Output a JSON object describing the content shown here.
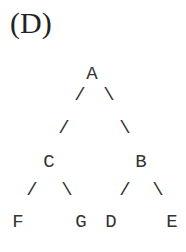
{
  "label": "(D)",
  "tree": {
    "nodes": [
      {
        "id": "A",
        "x": 92,
        "y": 65
      },
      {
        "id": "C",
        "x": 49,
        "y": 153
      },
      {
        "id": "B",
        "x": 141,
        "y": 153
      },
      {
        "id": "F",
        "x": 18,
        "y": 213
      },
      {
        "id": "G",
        "x": 81,
        "y": 213
      },
      {
        "id": "D",
        "x": 111,
        "y": 213
      },
      {
        "id": "E",
        "x": 172,
        "y": 213
      }
    ],
    "edges": [
      {
        "ch": "/",
        "x": 80,
        "y": 86
      },
      {
        "ch": "\\",
        "x": 109,
        "y": 86
      },
      {
        "ch": "/",
        "x": 64,
        "y": 119
      },
      {
        "ch": "\\",
        "x": 125,
        "y": 119
      },
      {
        "ch": "/",
        "x": 32,
        "y": 181
      },
      {
        "ch": "\\",
        "x": 67,
        "y": 181
      },
      {
        "ch": "/",
        "x": 125,
        "y": 181
      },
      {
        "ch": "\\",
        "x": 158,
        "y": 181
      }
    ]
  }
}
